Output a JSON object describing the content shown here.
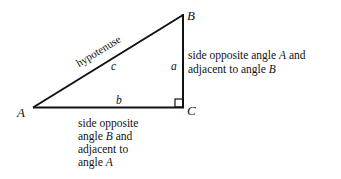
{
  "diagram": {
    "type": "right-triangle",
    "vertices": {
      "A": {
        "label": "A"
      },
      "B": {
        "label": "B"
      },
      "C": {
        "label": "C"
      }
    },
    "sides": {
      "a": {
        "label": "a"
      },
      "b": {
        "label": "b"
      },
      "c": {
        "label": "c"
      }
    },
    "hypotenuse_label": "hypotenuse",
    "right_angle_at": "C",
    "annotations": {
      "side_a": {
        "line1_pre": "side opposite angle ",
        "line1_var": "A",
        "line1_post": " and",
        "line2_pre": "adjacent to angle ",
        "line2_var": "B"
      },
      "side_b": {
        "line1": "side opposite",
        "line2_pre": "angle ",
        "line2_var": "B",
        "line2_post": " and",
        "line3": "adjacent to",
        "line4_pre": "angle ",
        "line4_var": "A"
      }
    },
    "colors": {
      "stroke": "#111111",
      "background": "#ffffff"
    }
  }
}
